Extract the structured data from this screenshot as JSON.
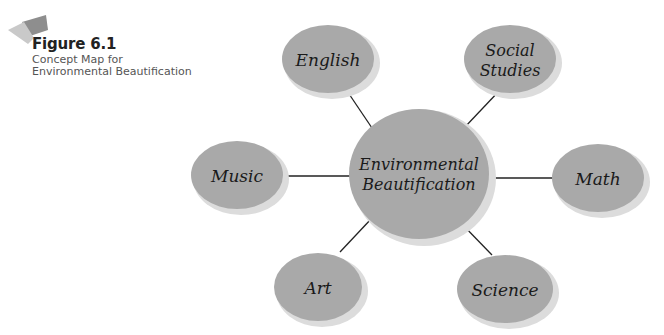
{
  "figure": {
    "number": "Figure 6.1",
    "caption_line1": "Concept Map for",
    "caption_line2": "Environmental Beautification"
  },
  "colors": {
    "node_fill": "#a9a9a9",
    "node_shadow": "#d8d8d8",
    "connector": "#222222",
    "tab_dark": "#8e8e8e",
    "tab_light": "#c9c9c9"
  },
  "center": {
    "id": "center",
    "line1": "Environmental",
    "line2": "Beautification"
  },
  "nodes": [
    {
      "id": "english",
      "line1": "English",
      "line2": ""
    },
    {
      "id": "social-studies",
      "line1": "Social",
      "line2": "Studies"
    },
    {
      "id": "math",
      "line1": "Math",
      "line2": ""
    },
    {
      "id": "science",
      "line1": "Science",
      "line2": ""
    },
    {
      "id": "art",
      "line1": "Art",
      "line2": ""
    },
    {
      "id": "music",
      "line1": "Music",
      "line2": ""
    }
  ]
}
